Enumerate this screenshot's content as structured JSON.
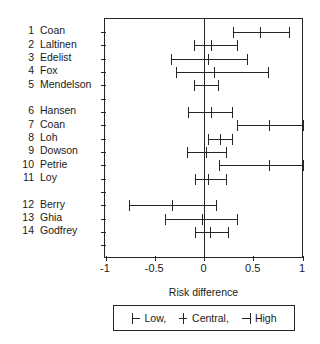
{
  "chart_data": {
    "type": "scatter",
    "title": "",
    "xlabel": "Risk difference",
    "ylabel": "",
    "xlim": [
      -1,
      1
    ],
    "xticks": [
      -1,
      -0.5,
      0,
      0.5,
      1
    ],
    "xticklabels": [
      "-1",
      "-0.5",
      "0",
      "0.5",
      "1"
    ],
    "grid": false,
    "zero_reference_line": 0,
    "legend": {
      "position": "below-axis",
      "entries": [
        {
          "symbol": "left-cap",
          "label": "Low,"
        },
        {
          "symbol": "plus-center",
          "label": "Central,"
        },
        {
          "symbol": "right-cap",
          "label": "High"
        }
      ]
    },
    "groups": [
      {
        "rows": [
          1,
          2,
          3,
          4,
          5
        ]
      },
      {
        "rows": [
          6,
          7,
          8,
          9,
          10,
          11
        ]
      },
      {
        "rows": [
          12,
          13,
          14
        ]
      }
    ],
    "studies": [
      {
        "num": "1",
        "name": "Coan",
        "low": 0.29,
        "central": 0.57,
        "high": 0.86
      },
      {
        "num": "2",
        "name": "Laltinen",
        "low": -0.1,
        "central": 0.07,
        "high": 0.33
      },
      {
        "num": "3",
        "name": "Edelist",
        "low": -0.34,
        "central": 0.04,
        "high": 0.44
      },
      {
        "num": "4",
        "name": "Fox",
        "low": -0.28,
        "central": 0.1,
        "high": 0.65
      },
      {
        "num": "5",
        "name": "Mendelson",
        "low": -0.1,
        "central": 0.0,
        "high": 0.14
      },
      {
        "num": "6",
        "name": "Hansen",
        "low": -0.16,
        "central": 0.07,
        "high": 0.28
      },
      {
        "num": "7",
        "name": "Coan",
        "low": 0.33,
        "central": 0.66,
        "high": 1.0
      },
      {
        "num": "8",
        "name": "Loh",
        "low": 0.04,
        "central": 0.16,
        "high": 0.28
      },
      {
        "num": "9",
        "name": "Dowson",
        "low": -0.17,
        "central": 0.02,
        "high": 0.22
      },
      {
        "num": "10",
        "name": "Petrie",
        "low": 0.15,
        "central": 0.66,
        "high": 1.0
      },
      {
        "num": "11",
        "name": "Loy",
        "low": -0.09,
        "central": 0.04,
        "high": 0.22
      },
      {
        "num": "12",
        "name": "Berry",
        "low": -0.76,
        "central": -0.32,
        "high": 0.12
      },
      {
        "num": "13",
        "name": "Ghia",
        "low": -0.4,
        "central": -0.02,
        "high": 0.34
      },
      {
        "num": "14",
        "name": "Godfrey",
        "low": -0.09,
        "central": 0.06,
        "high": 0.24
      }
    ]
  },
  "colors": {
    "ink": "#262626",
    "background": "#ffffff"
  }
}
